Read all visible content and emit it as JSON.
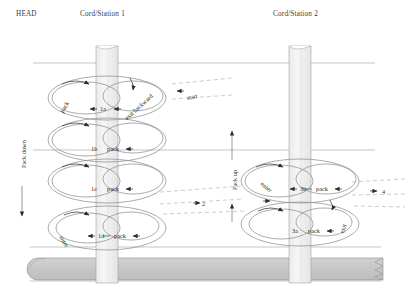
{
  "diagram": {
    "headers": [
      {
        "id": "head",
        "text": "HEAD",
        "x": 16,
        "y": 10
      },
      {
        "id": "station1",
        "text": "Cord/Station 1",
        "x": 80,
        "y": 10
      },
      {
        "id": "station2",
        "text": "Cord/Station 2",
        "x": 273,
        "y": 10
      }
    ],
    "direction_labels": [
      {
        "id": "pack-down",
        "text": "Pack down",
        "x": 20,
        "y": 168,
        "orientation": "vertical-up",
        "arrow": "down"
      },
      {
        "id": "pack-up",
        "text": "Pack up",
        "x": 231,
        "y": 190,
        "orientation": "vertical-up",
        "arrow": "up"
      }
    ],
    "step_labels": [
      {
        "id": "step-1a",
        "text": "1a",
        "x": 100,
        "y": 109
      },
      {
        "id": "step-1b",
        "text": "1b",
        "x": 91,
        "y": 149
      },
      {
        "id": "step-1c",
        "text": "1c",
        "x": 91,
        "y": 189
      },
      {
        "id": "step-1d",
        "text": "1d",
        "x": 98,
        "y": 236
      },
      {
        "id": "step-3b",
        "text": "3b",
        "x": 300,
        "y": 189
      },
      {
        "id": "step-3a",
        "text": "3a",
        "x": 292,
        "y": 231
      },
      {
        "id": "step-2",
        "text": "2",
        "x": 202,
        "y": 206
      },
      {
        "id": "step-4",
        "text": "4",
        "x": 383,
        "y": 194
      }
    ],
    "pack_labels": [
      {
        "id": "pack-1a",
        "text": "pack",
        "x": 61,
        "y": 106
      },
      {
        "id": "pack-1b",
        "text": "pack",
        "x": 107,
        "y": 149
      },
      {
        "id": "pack-1c",
        "text": "pack",
        "x": 107,
        "y": 189
      },
      {
        "id": "pack-1d",
        "text": "pack",
        "x": 114,
        "y": 236
      },
      {
        "id": "pack-3b",
        "text": "pack",
        "x": 316,
        "y": 189
      },
      {
        "id": "pack-3a",
        "text": "pack",
        "x": 308,
        "y": 231
      }
    ],
    "path_labels": [
      {
        "id": "exit-backward",
        "text": "exit backward",
        "x": 125,
        "y": 111
      },
      {
        "id": "start",
        "text": "start",
        "x": 186,
        "y": 94
      },
      {
        "id": "enter-1d",
        "text": "enter",
        "x": 66,
        "y": 239
      },
      {
        "id": "enter-3b",
        "text": "enter",
        "x": 266,
        "y": 185
      },
      {
        "id": "exit-3a",
        "text": "exit",
        "x": 337,
        "y": 228
      }
    ],
    "colors": {
      "band_fill": "#f2f2f2",
      "band_stroke": "#9a9a9a",
      "cover_fill": "#c9c9c9",
      "cover_stroke": "#8d8d8d",
      "thread": "#8c8c8c",
      "dashed": "#a8a8a8",
      "rule": "#999999",
      "text": "#2b2b2b"
    },
    "geometry": {
      "station1_x": 100,
      "station2_x": 293,
      "rules_y": [
        63,
        150,
        247
      ],
      "cover_y": 258,
      "cover_height": 22
    }
  }
}
